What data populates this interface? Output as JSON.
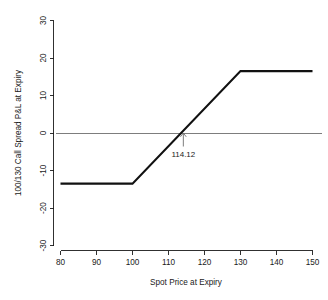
{
  "chart_data": {
    "type": "line",
    "title": "",
    "subtitle": "",
    "xlabel": "Spot Price at Expiry",
    "ylabel": "100/130 Call Spread P&L at Expiry",
    "xlim": [
      80,
      150
    ],
    "ylim": [
      -30,
      30
    ],
    "xticks": [
      80,
      90,
      100,
      110,
      120,
      130,
      140,
      150
    ],
    "yticks": [
      -30,
      -20,
      -10,
      0,
      10,
      20,
      30
    ],
    "xtick_labels": [
      "80",
      "90",
      "100",
      "110",
      "120",
      "130",
      "140",
      "150"
    ],
    "ytick_labels": [
      "-30",
      "-20",
      "-10",
      "0",
      "10",
      "20",
      "30"
    ],
    "grid": false,
    "legend": false,
    "series": [
      {
        "name": "100/130 Call Spread P&L at Expiry",
        "color": "#111111",
        "x": [
          80,
          100,
          130,
          150
        ],
        "values": [
          -13.5,
          -13.5,
          16.5,
          16.5
        ]
      }
    ],
    "reference_lines": [
      {
        "name": "zero-line",
        "orientation": "horizontal",
        "value": 0,
        "color": "#7d7d7d"
      }
    ],
    "annotations": [
      {
        "name": "breakeven",
        "label": "114.12",
        "x": 114.12,
        "y": 0,
        "color": "#6e6e6e"
      }
    ]
  },
  "axes": {
    "x_title": "Spot Price at Expiry",
    "y_title": "100/130 Call Spread P&L at Expiry",
    "x_ticks": [
      "80",
      "90",
      "100",
      "110",
      "120",
      "130",
      "140",
      "150"
    ],
    "y_ticks": [
      "30",
      "20",
      "10",
      "0",
      "-10",
      "-20",
      "-30"
    ]
  },
  "annotation": {
    "breakeven_label": "114.12"
  }
}
